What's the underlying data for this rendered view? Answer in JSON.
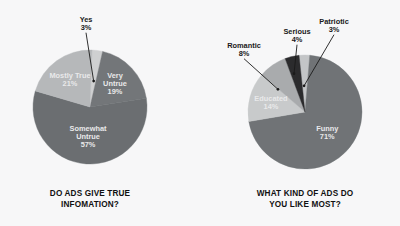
{
  "background_color": "#f7f7f8",
  "charts": [
    {
      "id": "do-ads-give-true-information",
      "title_line1": "DO ADS GIVE TRUE",
      "title_line2": "INFOMATION?",
      "cx": 90,
      "cy": 107,
      "r": 57,
      "start_angle": -88,
      "slices": [
        {
          "name": "Yes",
          "label": "Yes",
          "value": 3,
          "value_label": "3%",
          "color": "#cfd0d1",
          "label_mode": "outside",
          "leader_angle": -82,
          "lx": 86,
          "ly": 22,
          "dot_r": 0.46
        },
        {
          "name": "Very Untrue",
          "label": "Very",
          "label2": "Untrue",
          "value": 19,
          "value_label": "19%",
          "color": "#737679",
          "label_mode": "inside",
          "lr": 0.6
        },
        {
          "name": "Somewhat Untrue",
          "label": "Somewhat",
          "label2": "Untrue",
          "value": 57,
          "value_label": "57%",
          "color": "#6b6e71",
          "label_mode": "inside",
          "lr": 0.52
        },
        {
          "name": "Mostly True",
          "label": "Mostly True",
          "value": 21,
          "value_label": "21%",
          "color": "#b6b8ba",
          "label_mode": "inside",
          "lr": 0.6
        }
      ]
    },
    {
      "id": "what-kind-of-ads-do-you-like-most",
      "title_line1": "WHAT KIND OF ADS DO",
      "title_line2": "YOU LIKE MOST?",
      "cx": 105,
      "cy": 112,
      "r": 57,
      "start_angle": -96,
      "slices": [
        {
          "name": "Patriotic",
          "label": "Patriotic",
          "value": 3,
          "value_label": "3%",
          "color": "#c3c5c7",
          "label_mode": "outside",
          "leader_angle": -92,
          "lx": 134,
          "ly": 24,
          "dot_r": 0.46
        },
        {
          "name": "Funny",
          "label": "Funny",
          "value": 71,
          "value_label": "71%",
          "color": "#707376",
          "label_mode": "inside",
          "lr": 0.53
        },
        {
          "name": "Educated",
          "label": "Educated",
          "value": 14,
          "value_label": "14%",
          "color": "#c8cacb",
          "label_mode": "inside",
          "lr": 0.62
        },
        {
          "name": "Romantic",
          "label": "Romantic",
          "value": 8,
          "value_label": "8%",
          "color": "#a9abad",
          "label_mode": "outside",
          "leader_angle": -140,
          "lx": 44,
          "ly": 48,
          "dot_r": 0.62
        },
        {
          "name": "Serious",
          "label": "Serious",
          "value": 4,
          "value_label": "4%",
          "color": "#2b2b2d",
          "label_mode": "outside",
          "leader_angle": -106,
          "lx": 97,
          "ly": 34,
          "dot_r": 0.7
        }
      ]
    }
  ],
  "chart_data": [
    {
      "type": "pie",
      "title": "DO ADS GIVE TRUE INFOMATION?",
      "categories": [
        "Yes",
        "Very Untrue",
        "Somewhat Untrue",
        "Mostly True"
      ],
      "values": [
        3,
        19,
        57,
        21
      ],
      "value_labels": [
        "3%",
        "19%",
        "57%",
        "21%"
      ],
      "units": "percent",
      "total": 100,
      "colors": [
        "#cfd0d1",
        "#737679",
        "#6b6e71",
        "#b6b8ba"
      ],
      "legend": "none",
      "labels_position": "on-slice-with-leaders",
      "start_angle_deg": -88,
      "direction": "clockwise"
    },
    {
      "type": "pie",
      "title": "WHAT KIND OF ADS DO YOU LIKE MOST?",
      "categories": [
        "Patriotic",
        "Funny",
        "Educated",
        "Romantic",
        "Serious"
      ],
      "values": [
        3,
        71,
        14,
        8,
        4
      ],
      "value_labels": [
        "3%",
        "71%",
        "14%",
        "8%",
        "4%"
      ],
      "units": "percent",
      "total": 100,
      "colors": [
        "#c3c5c7",
        "#707376",
        "#c8cacb",
        "#a9abad",
        "#2b2b2d"
      ],
      "legend": "none",
      "labels_position": "on-slice-with-leaders",
      "start_angle_deg": -96,
      "direction": "clockwise"
    }
  ]
}
